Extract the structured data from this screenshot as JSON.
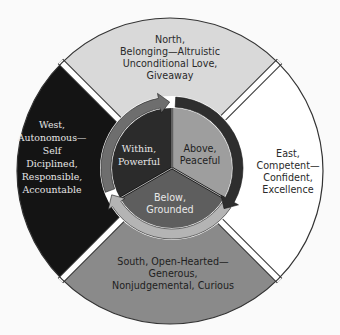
{
  "diagram": {
    "quadrants": [
      {
        "id": "north",
        "lines": [
          "North,",
          "Belonging—Altruistic",
          "Unconditional Love,",
          "Giveaway"
        ],
        "fill": "#d9d9d9",
        "text_color": "#2a2a2a"
      },
      {
        "id": "east",
        "lines": [
          "East,",
          "Competent—",
          "Confident,",
          "Excellence"
        ],
        "fill": "#ffffff",
        "text_color": "#2a2a2a"
      },
      {
        "id": "south",
        "lines": [
          "South, Open-Hearted—",
          "Generous,",
          "Nonjudgemental, Curious"
        ],
        "fill": "#8a8a8a",
        "text_color": "#1e1e1e"
      },
      {
        "id": "west",
        "lines": [
          "West,",
          "Autonomous—",
          "Self",
          "Diciplined,",
          "Responsible,",
          "Accountable"
        ],
        "fill": "#141414",
        "text_color": "#e6e6e6"
      }
    ],
    "inner_sectors": [
      {
        "id": "within",
        "lines": [
          "Within,",
          "Powerful"
        ],
        "fill": "#2b2b2b",
        "text_color": "#e8e8e8"
      },
      {
        "id": "above",
        "lines": [
          "Above,",
          "Peaceful"
        ],
        "fill": "#9e9e9e",
        "text_color": "#1e1e1e"
      },
      {
        "id": "below",
        "lines": [
          "Below,",
          "Grounded"
        ],
        "fill": "#5e5e5e",
        "text_color": "#e8e8e8"
      }
    ],
    "arrows": [
      {
        "id": "arrow-within-to-above",
        "fill": "#6e6e6e"
      },
      {
        "id": "arrow-above-to-below",
        "fill": "#2e2e2e"
      },
      {
        "id": "arrow-below-to-within",
        "fill": "#b4b4b4"
      }
    ],
    "outline_color": "#333333",
    "gap_color": "#ffffff"
  }
}
